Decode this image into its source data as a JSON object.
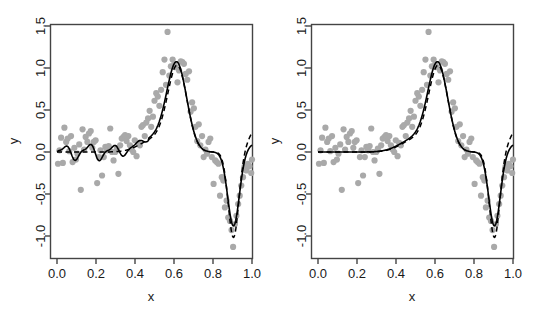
{
  "figure": {
    "background_color": "#ffffff",
    "panel_count": 2
  },
  "chart_data": [
    {
      "panel": "left",
      "type": "scatter",
      "title": "",
      "xlabel": "x",
      "ylabel": "y",
      "xlim": [
        0.0,
        1.0
      ],
      "ylim": [
        -1.25,
        1.5
      ],
      "xticks": [
        0.0,
        0.2,
        0.4,
        0.6,
        0.8,
        1.0
      ],
      "xticklabels": [
        "0.0",
        "0.2",
        "0.4",
        "0.6",
        "0.8",
        "1.0"
      ],
      "yticks": [
        -1.0,
        -0.5,
        0.0,
        0.5,
        1.0,
        1.5
      ],
      "yticklabels": [
        "-1.0",
        "-0.5",
        "0.0",
        "0.5",
        "1.0",
        "1.5"
      ],
      "grid": false,
      "legend": "none",
      "point_color": "#a9a9a9",
      "point_radius": 3.1,
      "series": [
        {
          "name": "observed-data",
          "style": "points",
          "color": "#a9a9a9",
          "x": [
            0.005,
            0.013,
            0.021,
            0.03,
            0.038,
            0.047,
            0.055,
            0.063,
            0.072,
            0.08,
            0.089,
            0.097,
            0.105,
            0.114,
            0.122,
            0.131,
            0.139,
            0.147,
            0.156,
            0.164,
            0.173,
            0.181,
            0.189,
            0.198,
            0.206,
            0.215,
            0.223,
            0.231,
            0.24,
            0.248,
            0.257,
            0.265,
            0.273,
            0.282,
            0.29,
            0.299,
            0.307,
            0.315,
            0.324,
            0.332,
            0.341,
            0.349,
            0.357,
            0.366,
            0.374,
            0.383,
            0.391,
            0.399,
            0.408,
            0.416,
            0.425,
            0.433,
            0.441,
            0.45,
            0.458,
            0.467,
            0.475,
            0.483,
            0.492,
            0.5,
            0.509,
            0.517,
            0.525,
            0.534,
            0.542,
            0.551,
            0.559,
            0.567,
            0.576,
            0.584,
            0.593,
            0.601,
            0.609,
            0.618,
            0.626,
            0.635,
            0.643,
            0.651,
            0.66,
            0.668,
            0.677,
            0.685,
            0.693,
            0.702,
            0.71,
            0.719,
            0.727,
            0.735,
            0.744,
            0.752,
            0.761,
            0.769,
            0.777,
            0.786,
            0.794,
            0.803,
            0.811,
            0.819,
            0.828,
            0.836,
            0.845,
            0.853,
            0.861,
            0.87,
            0.878,
            0.887,
            0.895,
            0.903,
            0.912,
            0.92,
            0.929,
            0.937,
            0.945,
            0.954,
            0.962,
            0.971,
            0.979,
            0.987,
            0.996,
            1.0
          ],
          "y": [
            -0.14,
            0.02,
            0.17,
            -0.13,
            0.29,
            0.12,
            0.16,
            0.01,
            0.19,
            -0.12,
            0.05,
            -0.09,
            -0.02,
            0.09,
            -0.45,
            0.27,
            0.03,
            0.18,
            0.12,
            0.22,
            0.25,
            0.05,
            0.12,
            0.14,
            -0.37,
            -0.06,
            0.02,
            -0.28,
            -0.06,
            0.06,
            0.02,
            0.07,
            0.28,
            0.0,
            -0.1,
            0.0,
            0.04,
            -0.26,
            0.08,
            0.16,
            0.18,
            0.2,
            0.13,
            0.19,
            0.08,
            0.03,
            0.0,
            0.14,
            -0.05,
            0.11,
            0.08,
            0.3,
            0.32,
            0.19,
            0.35,
            0.4,
            0.49,
            0.3,
            0.42,
            0.61,
            0.7,
            0.66,
            0.55,
            0.74,
            0.95,
            1.1,
            0.8,
            1.43,
            0.91,
            1.02,
            1.1,
            1.04,
            1.01,
            0.83,
            0.97,
            1.08,
            1.07,
            1.05,
            0.93,
            0.86,
            0.96,
            0.48,
            0.59,
            0.52,
            0.3,
            0.13,
            0.33,
            0.08,
            0.19,
            -0.06,
            0.03,
            -0.02,
            0.12,
            0.16,
            -0.06,
            -0.38,
            -0.1,
            -0.12,
            -0.14,
            -0.52,
            -0.3,
            -0.34,
            -0.66,
            -0.58,
            -0.78,
            -0.82,
            -0.93,
            -1.13,
            -0.86,
            -0.76,
            -0.62,
            -0.52,
            -0.4,
            -0.3,
            -0.17,
            -0.22,
            -0.14,
            -0.17,
            -0.25,
            -0.09
          ]
        },
        {
          "name": "fit-solid-wiggly",
          "style": "solid-line",
          "color": "#000000",
          "description": "undersmoothed fit with local oscillations in the flat region"
        },
        {
          "name": "fit-dashed",
          "style": "dashed-line",
          "color": "#000000",
          "description": "reference fit, flat at zero on the left, deeper trough near x=0.9"
        }
      ]
    },
    {
      "panel": "right",
      "type": "scatter",
      "title": "",
      "xlabel": "x",
      "ylabel": "y",
      "xlim": [
        0.0,
        1.0
      ],
      "ylim": [
        -1.25,
        1.5
      ],
      "xticks": [
        0.0,
        0.2,
        0.4,
        0.6,
        0.8,
        1.0
      ],
      "xticklabels": [
        "0.0",
        "0.2",
        "0.4",
        "0.6",
        "0.8",
        "1.0"
      ],
      "yticks": [
        -1.0,
        -0.5,
        0.0,
        0.5,
        1.0,
        1.5
      ],
      "yticklabels": [
        "-1.0",
        "-0.5",
        "0.0",
        "0.5",
        "1.0",
        "1.5"
      ],
      "grid": false,
      "legend": "none",
      "point_color": "#a9a9a9",
      "point_radius": 3.1,
      "series": [
        {
          "name": "observed-data",
          "style": "points",
          "color": "#a9a9a9",
          "shared_with": "left-panel"
        },
        {
          "name": "fit-solid-smooth",
          "style": "solid-line",
          "color": "#000000",
          "description": "smooth fit, flat at zero on the left, no oscillations"
        },
        {
          "name": "fit-dashed",
          "style": "dashed-line",
          "color": "#000000",
          "description": "reference fit, deeper trough near x=0.9"
        }
      ]
    }
  ]
}
